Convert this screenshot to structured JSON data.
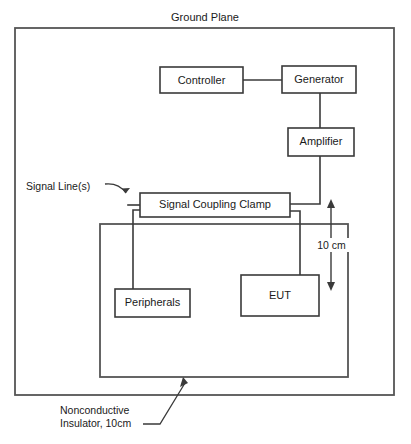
{
  "diagram": {
    "title": "Ground Plane",
    "type": "EMC signal coupling clamp test setup",
    "colors": {
      "background": "#ffffff",
      "line": "#3a3a3a",
      "frame": "#555555",
      "text": "#1a1a1a"
    },
    "boxes": {
      "controller": "Controller",
      "generator": "Generator",
      "amplifier": "Amplifier",
      "clamp": "Signal Coupling Clamp",
      "eut": "EUT",
      "peripherals": "Peripherals"
    },
    "annotations": {
      "signal_lines": "Signal Line(s)",
      "separation": "10 cm",
      "insulator_line1": "Nonconductive",
      "insulator_line2": "Insulator, 10cm"
    },
    "icons": {
      "signal_line_pointer": "arrow-down-right-icon",
      "insulator_pointer": "arrow-up-right-icon",
      "dimension_arrow": "double-headed-vertical-arrow-icon"
    }
  }
}
